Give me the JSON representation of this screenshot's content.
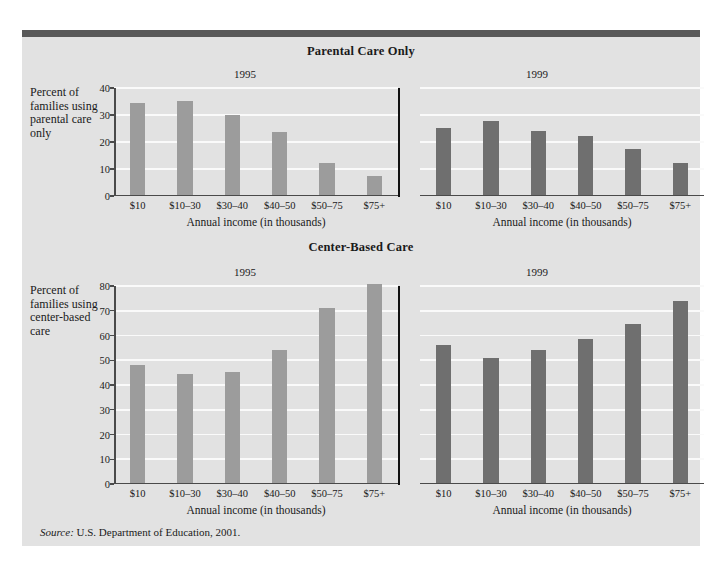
{
  "figure": {
    "source_note_label": "Source:",
    "source_note_text": " U.S. Department of Education, 2001."
  },
  "colors": {
    "panel_background": "#e2e2e2",
    "top_rule": "#595959",
    "bar_1995": "#9c9c9c",
    "bar_1999": "#6f6f6f",
    "gridline": "#fafafa",
    "axis": "#4a4a4a",
    "divider": "#111111"
  },
  "charts": [
    {
      "id": "parental",
      "title": "Parental Care Only",
      "ylabel": "Percent of families using parental care only",
      "xlabel_left": "Annual income (in thousands)",
      "xlabel_right": "Annual income (in thousands)",
      "yticks": [
        "40",
        "30",
        "20",
        "10",
        "0"
      ],
      "panels": [
        {
          "year": "1995"
        },
        {
          "year": "1999"
        }
      ]
    },
    {
      "id": "center",
      "title": "Center-Based Care",
      "ylabel": "Percent of families using center-based care",
      "xlabel_left": "Annual income (in thousands)",
      "xlabel_right": "Annual income (in thousands)",
      "yticks": [
        "80",
        "70",
        "60",
        "50",
        "40",
        "30",
        "20",
        "10",
        "0"
      ],
      "panels": [
        {
          "year": "1995"
        },
        {
          "year": "1999"
        }
      ]
    }
  ],
  "chart_data": [
    {
      "type": "bar",
      "title": "Parental Care Only",
      "xlabel": "Annual income (in thousands)",
      "ylabel": "Percent of families using parental care only",
      "categories": [
        "$10",
        "$10–30",
        "$30–40",
        "$40–50",
        "$50–75",
        "$75+"
      ],
      "ylim": [
        0,
        40
      ],
      "yticks": [
        0,
        10,
        20,
        30,
        40
      ],
      "grid": true,
      "legend": "none",
      "series": [
        {
          "name": "1995",
          "color": "#9c9c9c",
          "values": [
            34.5,
            35.0,
            30.0,
            23.5,
            12.0,
            7.0
          ]
        },
        {
          "name": "1999",
          "color": "#6f6f6f",
          "values": [
            25.0,
            27.5,
            24.0,
            22.0,
            17.0,
            12.0
          ]
        }
      ]
    },
    {
      "type": "bar",
      "title": "Center-Based Care",
      "xlabel": "Annual income (in thousands)",
      "ylabel": "Percent of families using center-based care",
      "categories": [
        "$10",
        "$10–30",
        "$30–40",
        "$40–50",
        "$50–75",
        "$75+"
      ],
      "ylim": [
        0,
        80
      ],
      "yticks": [
        0,
        10,
        20,
        30,
        40,
        50,
        60,
        70,
        80
      ],
      "grid": true,
      "legend": "none",
      "series": [
        {
          "name": "1995",
          "color": "#9c9c9c",
          "values": [
            48.0,
            44.0,
            45.0,
            54.0,
            71.0,
            81.0
          ]
        },
        {
          "name": "1999",
          "color": "#6f6f6f",
          "values": [
            56.0,
            50.5,
            54.0,
            58.5,
            64.5,
            74.0
          ]
        }
      ]
    }
  ]
}
